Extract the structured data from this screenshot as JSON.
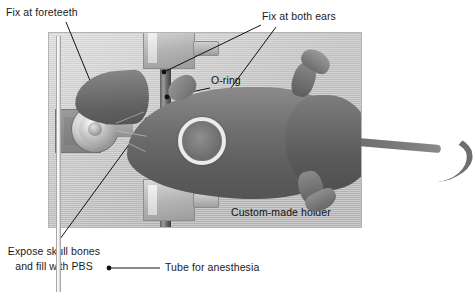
{
  "figure": {
    "type": "photograph-with-annotations",
    "background_color": "#ffffff",
    "photo_background_color": "#cacaca"
  },
  "labels": {
    "fix_foreteeth": "Fix at foreteeth",
    "fix_both_ears": "Fix at both ears",
    "o_ring": "O-ring",
    "custom_holder": "Custom-made holder",
    "expose_skull_line1": "Expose skull bones",
    "expose_skull_line2": "and fill with PBS",
    "tube_anesthesia": "Tube for anesthesia"
  },
  "annotation_targets": [
    {
      "name": "fix-at-foreteeth",
      "label": "Fix at foreteeth",
      "marker_x": 107,
      "marker_y": 123
    },
    {
      "name": "fix-at-both-ears-upper",
      "label": "Fix at both ears",
      "marker_x": 163,
      "marker_y": 72
    },
    {
      "name": "fix-at-both-ears-lower",
      "label": "Fix at both ears",
      "marker_x": 163,
      "marker_y": 180
    },
    {
      "name": "o-ring",
      "label": "O-ring",
      "marker_x": 166,
      "marker_y": 97
    },
    {
      "name": "expose-skull-bones",
      "label": "Expose skull bones and fill with PBS",
      "marker_x": 147,
      "marker_y": 120
    },
    {
      "name": "tube-for-anesthesia",
      "label": "Tube for anesthesia",
      "marker_x": 108,
      "marker_y": 268
    }
  ],
  "photo_region": {
    "x": 48,
    "y": 32,
    "width": 314,
    "height": 196
  },
  "parts": {
    "holder_plate": "custom-made holder plate",
    "bite_bar_block": "foreteeth fixation block",
    "ear_bar_rod": "vertical ear bar",
    "clamp_top": "upper ear clamp",
    "clamp_bottom": "lower ear clamp",
    "anesthesia_tube": "anesthesia delivery tube",
    "o_ring": "o-ring sealing exposed skull",
    "mouse": "anesthetized mouse"
  }
}
